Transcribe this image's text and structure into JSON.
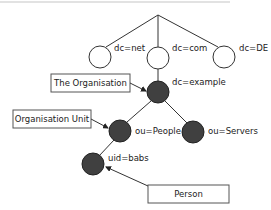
{
  "diagram": {
    "colors": {
      "line": "#333333",
      "filled_node": "#404040",
      "empty_node": "#ffffff",
      "top_rule": "#d8d8d8"
    },
    "root": {
      "x": 158,
      "y": 15
    },
    "nodes": [
      {
        "id": "net",
        "label": "dc=net",
        "x": 100,
        "y": 57,
        "filled": false
      },
      {
        "id": "com",
        "label": "dc=com",
        "x": 158,
        "y": 58,
        "filled": false
      },
      {
        "id": "de",
        "label": "dc=DE",
        "x": 224,
        "y": 57,
        "filled": false
      },
      {
        "id": "example",
        "label": "dc=example",
        "x": 158,
        "y": 92,
        "filled": true
      },
      {
        "id": "people",
        "label": "ou=People",
        "x": 120,
        "y": 131,
        "filled": true
      },
      {
        "id": "servers",
        "label": "ou=Servers",
        "x": 193,
        "y": 132,
        "filled": true
      },
      {
        "id": "babs",
        "label": "uid=babs",
        "x": 93,
        "y": 164,
        "filled": true
      }
    ],
    "callouts": [
      {
        "id": "organisation",
        "label": "The Organisation",
        "x": 51,
        "y": 74,
        "w": 79,
        "h": 18,
        "target": "example"
      },
      {
        "id": "org-unit",
        "label": "Organisation Unit",
        "x": 13,
        "y": 110,
        "w": 78,
        "h": 18,
        "target": "people"
      },
      {
        "id": "person",
        "label": "Person",
        "x": 148,
        "y": 185,
        "w": 81,
        "h": 18,
        "target": "babs"
      }
    ]
  }
}
